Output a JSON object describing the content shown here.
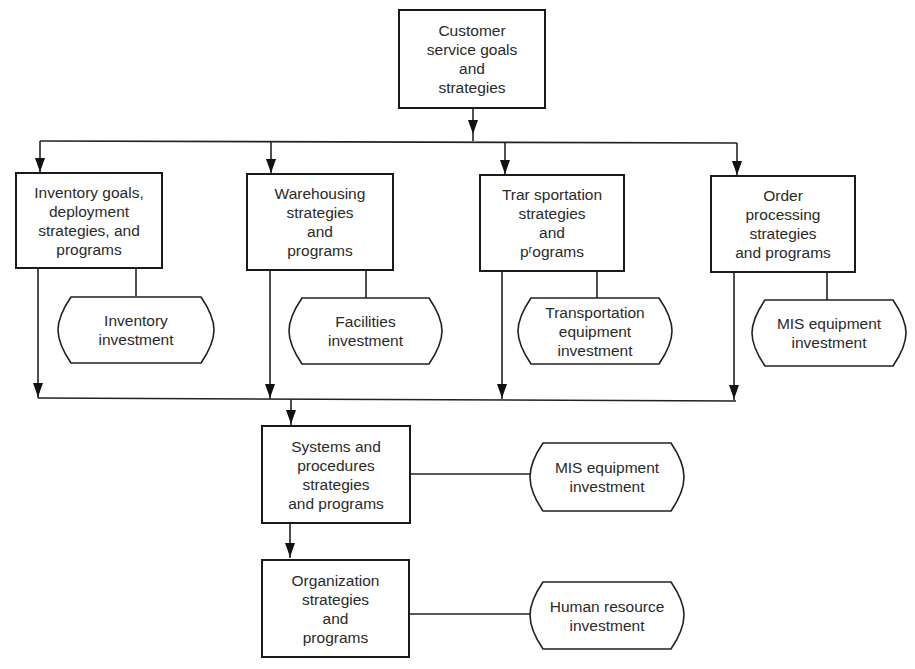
{
  "diagram": {
    "top": {
      "label": "Customer\nservice goals\nand\nstrategies"
    },
    "functions": [
      {
        "label": "Inventory goals,\ndeployment\nstrategies, and\nprograms",
        "investment": "Inventory\ninvestment"
      },
      {
        "label": "Warehousing\nstrategies\nand\nprograms",
        "investment": "Facilities\ninvestment"
      },
      {
        "label": "Trar sportation\nstrategies\nand\npʳograms",
        "investment": "Transportation\nequipment\ninvestment"
      },
      {
        "label": "Order\nprocessing\nstrategies\nand programs",
        "investment": "MIS equipment\ninvestment"
      }
    ],
    "systems": {
      "label": "Systems and\nprocedures\nstrategies\nand  programs",
      "investment": "MIS equipment\ninvestment"
    },
    "organization": {
      "label": "Organization\nstrategies\nand\nprograms",
      "investment": "Human resource\ninvestment"
    }
  }
}
